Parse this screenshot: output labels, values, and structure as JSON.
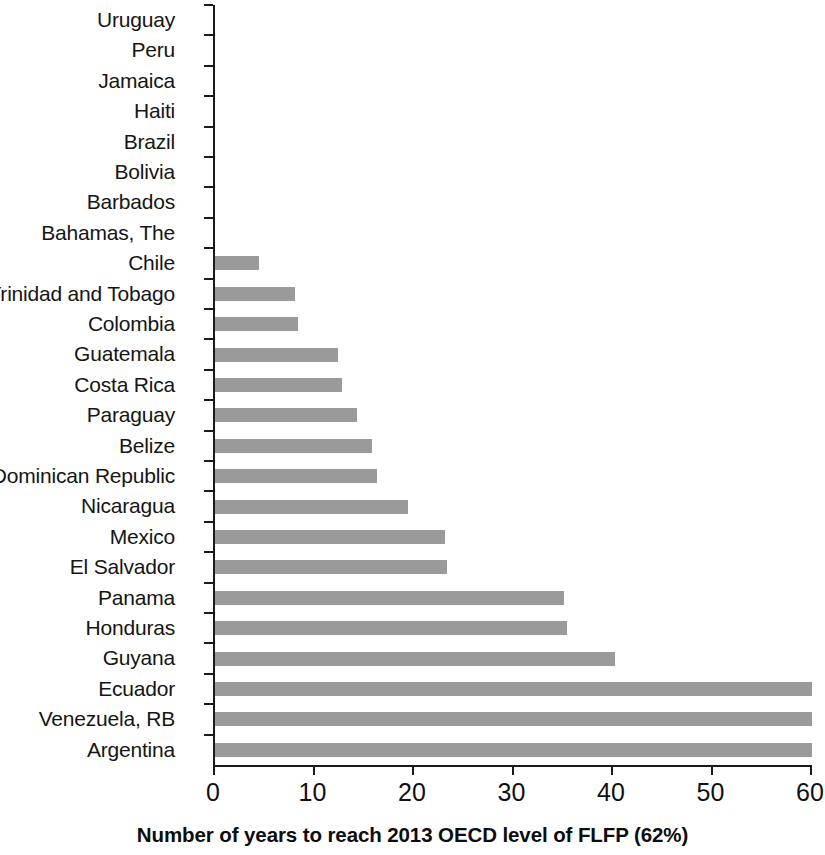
{
  "chart_data": {
    "type": "bar",
    "orientation": "horizontal",
    "title": "",
    "xlabel": "Number of years to reach 2013 OECD level of FLFP (62%)",
    "ylabel": "",
    "xlim": [
      0,
      60
    ],
    "xticks": [
      0,
      10,
      20,
      30,
      40,
      50,
      60
    ],
    "xtick_labels": [
      "0",
      "10",
      "20",
      "30",
      "40",
      "50",
      "60"
    ],
    "grid": false,
    "legend": null,
    "bar_color": "#9a9a9a",
    "axis_color": "#1a1a1a",
    "categories": [
      "Uruguay",
      "Peru",
      "Jamaica",
      "Haiti",
      "Brazil",
      "Bolivia",
      "Barbados",
      "Bahamas, The",
      "Chile",
      "Trinidad and Tobago",
      "Colombia",
      "Guatemala",
      "Costa Rica",
      "Paraguay",
      "Belize",
      "Dominican Republic",
      "Nicaragua",
      "Mexico",
      "El Salvador",
      "Panama",
      "Honduras",
      "Guyana",
      "Ecuador",
      "Venezuela, RB",
      "Argentina"
    ],
    "values": [
      0,
      0,
      0,
      0,
      0,
      0,
      0,
      0,
      4.4,
      8.0,
      8.3,
      12.4,
      12.8,
      14.3,
      15.8,
      16.3,
      19.4,
      23.1,
      23.3,
      35.1,
      35.4,
      40.2,
      60,
      60,
      60
    ]
  }
}
